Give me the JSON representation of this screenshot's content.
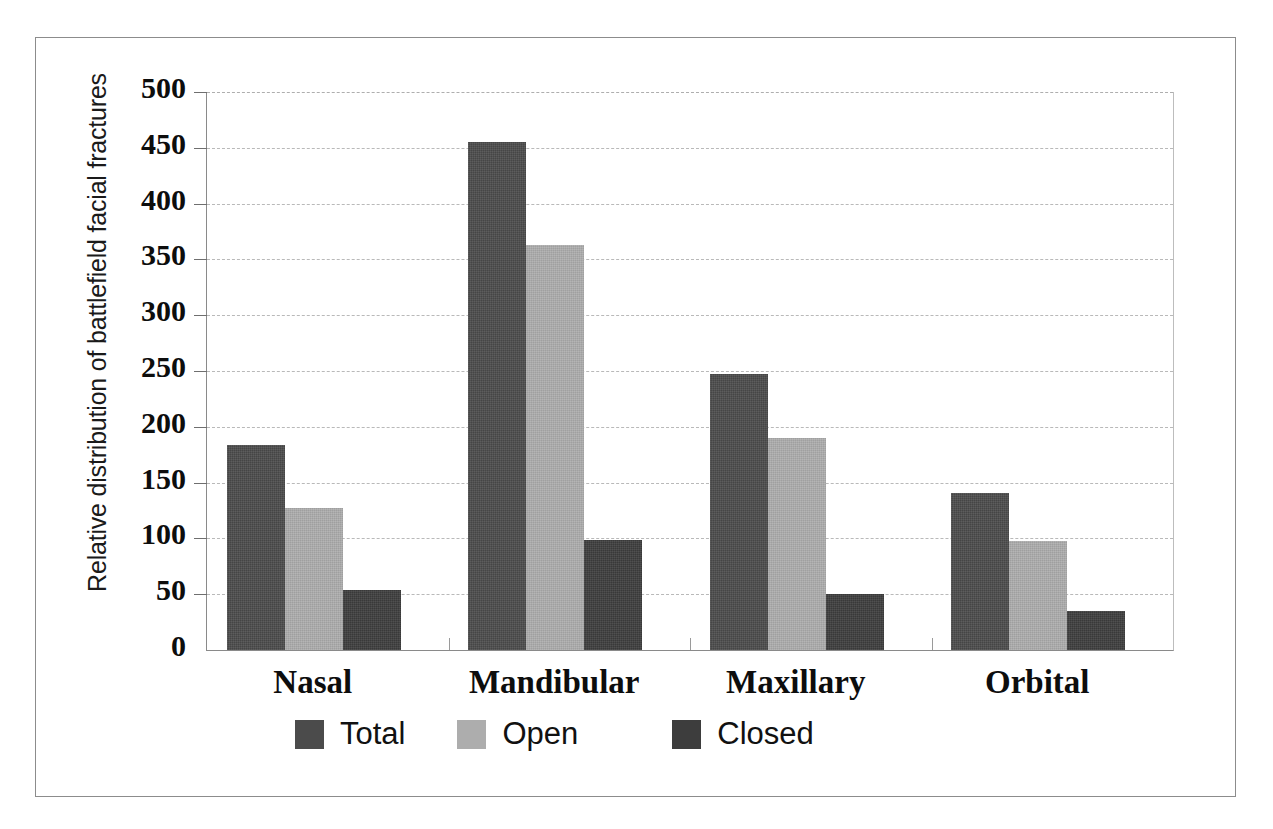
{
  "chart_data": {
    "type": "bar",
    "title": "",
    "xlabel": "",
    "ylabel": "Relative distribution of battlefield facial fractures",
    "categories": [
      "Nasal",
      "Mandibular",
      "Maxillary",
      "Orbital"
    ],
    "series": [
      {
        "name": "Total",
        "color": "#4b4b4b",
        "values": [
          184,
          455,
          247,
          141
        ]
      },
      {
        "name": "Open",
        "color": "#adadad",
        "values": [
          127,
          363,
          190,
          98
        ]
      },
      {
        "name": "Closed",
        "color": "#3d3d3d",
        "values": [
          54,
          99,
          50,
          35
        ]
      }
    ],
    "ylim": [
      0,
      500
    ],
    "ytick_step": 50,
    "yticks": [
      "500",
      "450",
      "400",
      "350",
      "300",
      "250",
      "200",
      "150",
      "100",
      "50",
      "0"
    ],
    "grid": true,
    "grid_axis": "y",
    "grid_style": "dashed",
    "legend_position": "bottom",
    "legend_entries": [
      "Total",
      "Open",
      "Closed"
    ]
  },
  "axis": {
    "y_title": "Relative distribution of battlefield facial fractures"
  },
  "caption": {
    "remnant": ""
  }
}
